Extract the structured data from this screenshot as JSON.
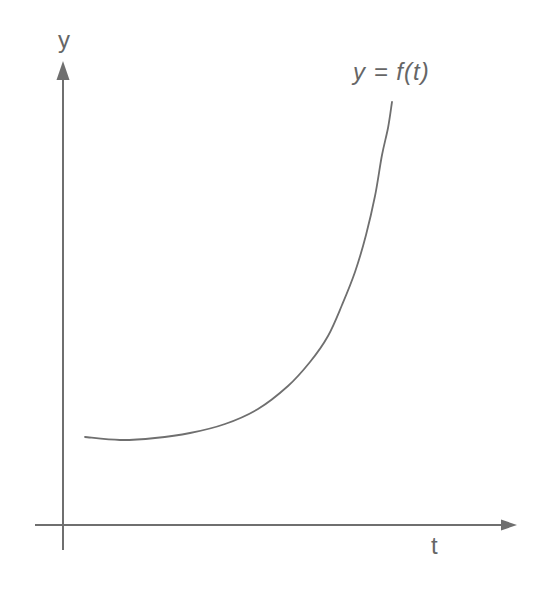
{
  "figure": {
    "background_color": "#ffffff",
    "stroke_color": "#6f6f6f",
    "text_color": "#666666",
    "y_axis_label": "y",
    "x_axis_label": "t",
    "curve_label": "y = f(t)"
  },
  "chart_data": {
    "type": "line",
    "title": "",
    "xlabel": "t",
    "ylabel": "y",
    "annotation": "y = f(t)",
    "legend": "none",
    "grid": false,
    "tick_labels": "none",
    "shape": "monotone exponential-style growth curve starting nearly flat just above the t-axis origin and rising steeply toward the annotation at top right",
    "axes": {
      "y": {
        "x": 63,
        "y1": 77,
        "y2": 550,
        "arrow_points": "63,61 56.5,80 69.5,80"
      },
      "x": {
        "y": 525,
        "x1": 35,
        "x2": 502,
        "arrow_points": "517,525 501,519.5 501,530.5"
      }
    },
    "curve_points_px": [
      [
        85,
        437
      ],
      [
        120,
        440
      ],
      [
        155,
        438
      ],
      [
        190,
        433
      ],
      [
        225,
        424
      ],
      [
        258,
        409
      ],
      [
        288,
        386
      ],
      [
        310,
        362
      ],
      [
        328,
        336
      ],
      [
        342,
        305
      ],
      [
        355,
        272
      ],
      [
        366,
        235
      ],
      [
        375,
        196
      ],
      [
        382,
        155
      ],
      [
        388,
        128
      ],
      [
        392,
        102
      ]
    ],
    "series_normalized": {
      "name": "f(t)",
      "t": [
        0.0,
        0.11,
        0.23,
        0.34,
        0.46,
        0.56,
        0.66,
        0.73,
        0.79,
        0.83,
        0.88,
        0.91,
        0.94,
        0.96,
        0.98,
        1.0
      ],
      "y": [
        0.21,
        0.2,
        0.21,
        0.22,
        0.24,
        0.27,
        0.33,
        0.39,
        0.45,
        0.52,
        0.6,
        0.69,
        0.78,
        0.87,
        0.94,
        1.0
      ],
      "xlim": [
        0,
        1
      ],
      "ylim": [
        0,
        1
      ]
    }
  }
}
